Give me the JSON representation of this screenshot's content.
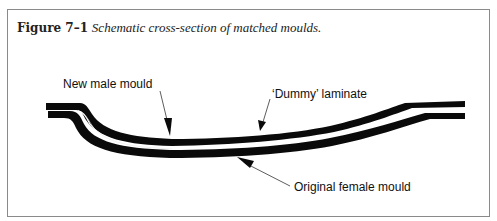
{
  "figure": {
    "number": "Figure 7–1",
    "caption": "Schematic cross-section of matched moulds."
  },
  "labels": {
    "male_mould": "New male mould",
    "dummy_laminate": "‘Dummy’ laminate",
    "female_mould": "Original female mould"
  },
  "colors": {
    "mould": "#0a0a0a",
    "laminate_gap": "#ffffff",
    "frame_border": "#8a8a8a",
    "leader_line": "#333333"
  }
}
